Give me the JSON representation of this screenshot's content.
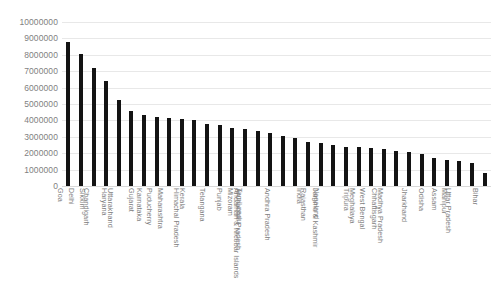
{
  "chart_data": {
    "type": "bar",
    "title": "",
    "xlabel": "",
    "ylabel": "",
    "ylim": [
      0,
      10000000
    ],
    "grid": true,
    "legend": "none",
    "y_ticks": [
      "10000000",
      "9000000",
      "8000000",
      "7000000",
      "6000000",
      "5000000",
      "4000000",
      "3000000",
      "2000000",
      "1000000",
      "0"
    ],
    "y_tick_values": [
      10000000,
      9000000,
      8000000,
      7000000,
      6000000,
      5000000,
      4000000,
      3000000,
      2000000,
      1000000,
      0
    ],
    "bar_color": "#131313",
    "grid_color": "#e8e8e8",
    "tick_label_color": "#7f7f7f",
    "categories": [
      "Goa",
      "Delhi",
      "Sikkim",
      "Chandigarh",
      "Haryana",
      "Uttarakhand",
      "Gujarat",
      "Karnataka",
      "Puducherry",
      "Maharashtra",
      "Kerala",
      "Himachal Pradesh",
      "Telangana",
      "Punjab",
      "Mizoram",
      "Tamil nadu",
      "Arunachal Pradesh",
      "Andaman & Nicobar Islands",
      "Andhra Pradesh",
      "India",
      "Rajasthan",
      "Nagaland",
      "Jammu & Kashmir",
      "Tripura",
      "Meghalaya",
      "West Bengal",
      "Chhattisgarh",
      "Madhya Pradesh",
      "Jharkhand",
      "Odisha",
      "Assam",
      "Manipur",
      "Uttar Pradesh",
      "Bihar"
    ],
    "values": [
      8800000,
      8050000,
      7200000,
      6400000,
      5250000,
      4550000,
      4300000,
      4200000,
      4150000,
      4100000,
      4000000,
      3800000,
      3700000,
      3550000,
      3450000,
      3350000,
      3250000,
      3050000,
      2900000,
      2700000,
      2600000,
      2500000,
      2400000,
      2350000,
      2300000,
      2250000,
      2150000,
      2050000,
      1950000,
      1700000,
      1600000,
      1500000,
      1400000,
      800000
    ]
  }
}
